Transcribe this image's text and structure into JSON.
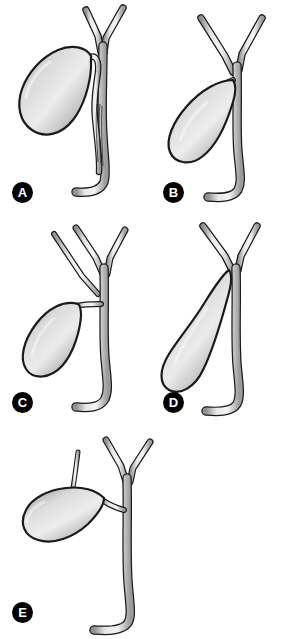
{
  "figure": {
    "background_color": "#ffffff",
    "style": "grayscale medical line illustration with airbrush shading",
    "panel_count": 5,
    "layout": "two columns of two panels, fifth panel centered below"
  },
  "palette": {
    "background": "#ffffff",
    "outline": "#1a1a1a",
    "duct_light": "#f2f2f2",
    "duct_mid": "#c9c9c9",
    "duct_shadow": "#8a8a8a",
    "gallbladder_highlight": "#ededed",
    "gallbladder_mid": "#c2c2c2",
    "gallbladder_shadow": "#8f8f8f",
    "label_fill": "#000000",
    "label_text": "#ffffff"
  },
  "panels": [
    {
      "id": "a",
      "label": "A",
      "variant": "Long parallel course of the cystic duct adherent to the common hepatic duct with low union",
      "structures": [
        "right hepatic duct",
        "left hepatic duct",
        "common hepatic duct",
        "gallbladder",
        "cystic duct running parallel to the common duct",
        "common bile duct",
        "distal duct curving toward the duodenum"
      ]
    },
    {
      "id": "b",
      "label": "B",
      "variant": "High insertion of the cystic duct near the hepatic duct confluence",
      "structures": [
        "right hepatic duct",
        "left hepatic duct",
        "hepatic duct confluence",
        "gallbladder",
        "short cystic duct inserting high",
        "common bile duct"
      ]
    },
    {
      "id": "c",
      "label": "C",
      "variant": "Accessory (aberrant) hepatic duct entering the common hepatic duct above the cystic duct",
      "structures": [
        "accessory hepatic duct",
        "right hepatic duct",
        "left hepatic duct",
        "common hepatic duct",
        "gallbladder",
        "cystic duct",
        "common bile duct"
      ]
    },
    {
      "id": "d",
      "label": "D",
      "variant": "Absent or extremely short cystic duct with the gallbladder neck abutting the common duct",
      "structures": [
        "right hepatic duct",
        "left hepatic duct",
        "gallbladder with elongated neck",
        "absent cystic duct",
        "common bile duct"
      ]
    },
    {
      "id": "e",
      "label": "E",
      "variant": "Accessory hepatic duct draining directly into the gallbladder",
      "structures": [
        "accessory hepatic duct entering the gallbladder",
        "right hepatic duct",
        "left hepatic duct",
        "gallbladder",
        "cystic duct",
        "common bile duct"
      ]
    }
  ]
}
